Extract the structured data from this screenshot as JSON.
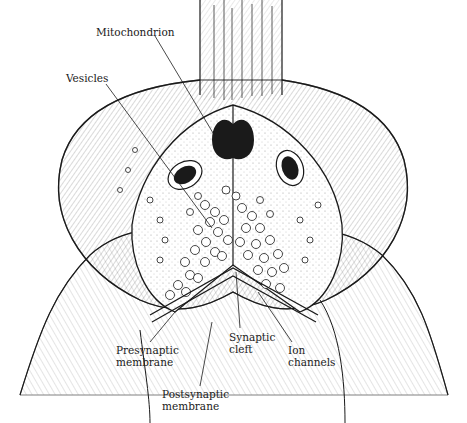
{
  "figure": {
    "style": "pen-and-ink line drawing",
    "ink_color": "#1a1a1a",
    "background": "#ffffff"
  },
  "labels": [
    {
      "id": "mitochondrion",
      "text": "Mitochondrion",
      "x": 96,
      "y": 26
    },
    {
      "id": "vesicles",
      "text": "Vesicles",
      "x": 66,
      "y": 72
    },
    {
      "id": "presynaptic-membrane",
      "text": "Presynaptic\nmembrane",
      "x": 116,
      "y": 344
    },
    {
      "id": "synaptic-cleft",
      "text": "Synaptic\ncleft",
      "x": 229,
      "y": 331
    },
    {
      "id": "ion-channels",
      "text": "Ion\nchannels",
      "x": 288,
      "y": 344
    },
    {
      "id": "postsynaptic-membrane",
      "text": "Postsynaptic\nmembrane",
      "x": 162,
      "y": 388
    }
  ]
}
